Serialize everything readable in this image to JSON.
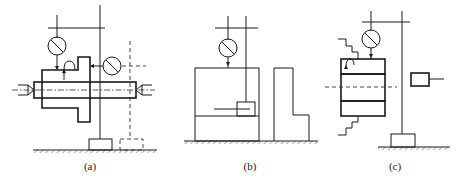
{
  "figure": {
    "panels": [
      {
        "id": "a",
        "label": "(a)",
        "description": "Dial indicators measuring runout of a flanged part on a mandrel between centers"
      },
      {
        "id": "b",
        "label": "(b)",
        "description": "Dial indicator measuring parallelism with a height gauge stand"
      },
      {
        "id": "c",
        "label": "(c)",
        "description": "Dial indicator measuring a bushing with hatched walls"
      }
    ]
  },
  "colors": {
    "line": "#1a1a1a",
    "background": "#ffffff"
  }
}
